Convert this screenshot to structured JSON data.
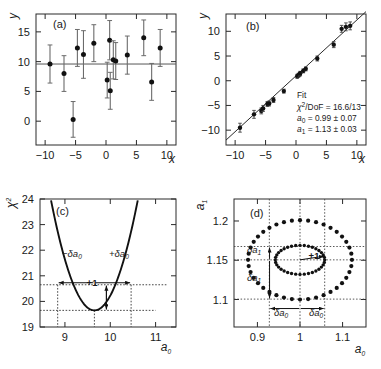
{
  "figure": {
    "panels": [
      "(a)",
      "(b)",
      "(c)",
      "(d)"
    ]
  },
  "panel_a": {
    "label": "(a)",
    "xlabel": "x",
    "ylabel": "y"
  },
  "panel_b": {
    "label": "(b)",
    "xlabel": "x",
    "ylabel": "y",
    "fit_title": "Fit",
    "fit_chi2": "/DoF = 16.6/13",
    "fit_chi2_sym": "χ",
    "fit_chi2_sup": "2",
    "fit_a0": " = 0.99 ± 0.07",
    "fit_a1": " = 1.13 ± 0.03",
    "fit_a_sym": "a",
    "fit_a0_sub": "0",
    "fit_a1_sub": "1"
  },
  "panel_c": {
    "label": "(c)",
    "xlabel_sym": "a",
    "xlabel_sub": "0",
    "ylabel_sym": "χ",
    "ylabel_sup": "2",
    "annot_minus": "−δa",
    "annot_plus": "+δa",
    "annot_sub": "0",
    "annot_plus_one": "+1"
  },
  "panel_d": {
    "label": "(d)",
    "xlabel_sym": "a",
    "xlabel_sub": "0",
    "ylabel_sym": "a",
    "ylabel_sub": "1",
    "annot_da1": "δa",
    "annot_da1_sub": "1",
    "annot_da0": "δa",
    "annot_da0_sub": "0",
    "annot_plus_one": "+1"
  },
  "chart_data": [
    {
      "type": "scatter",
      "panel": "(a)",
      "title": "(a)",
      "xlabel": "x",
      "ylabel": "y",
      "xlim": [
        -11.5,
        11.5
      ],
      "ylim": [
        -4.0,
        18.0
      ],
      "xticks": [
        -10,
        -5,
        0,
        5,
        10
      ],
      "yticks": [
        0,
        5,
        10,
        15
      ],
      "grid": false,
      "hline": 9.6,
      "x": [
        -9.2,
        -6.9,
        -5.4,
        -4.7,
        -3.7,
        -2.0,
        0.2,
        0.6,
        0.7,
        1.2,
        1.6,
        3.5,
        6.2,
        7.5,
        8.9
      ],
      "y": [
        9.6,
        8.0,
        0.3,
        12.3,
        11.2,
        13.1,
        6.9,
        13.6,
        5.1,
        10.3,
        10.1,
        11.1,
        14.0,
        6.6,
        12.3
      ],
      "yerr": [
        3.2,
        3.0,
        3.0,
        3.1,
        4.0,
        3.1,
        3.0,
        3.3,
        3.1,
        3.2,
        3.1,
        3.2,
        3.0,
        3.1,
        3.1
      ]
    },
    {
      "type": "scatter",
      "panel": "(b)",
      "title": "(b)",
      "xlabel": "x",
      "ylabel": "y",
      "xlim": [
        -11.5,
        11.5
      ],
      "ylim": [
        -13.0,
        13.5
      ],
      "xticks": [
        -10,
        -5,
        0,
        5,
        10
      ],
      "yticks": [
        -10,
        -5,
        0,
        5,
        10
      ],
      "grid": false,
      "fit_line": {
        "intercept": 0.99,
        "slope": 1.13
      },
      "x": [
        -9.2,
        -6.9,
        -5.7,
        -5.4,
        -4.7,
        -4.4,
        -3.7,
        -2.0,
        0.2,
        0.4,
        0.6,
        0.7,
        1.2,
        1.6,
        3.5,
        6.2,
        7.5,
        8.2,
        8.9
      ],
      "y": [
        -9.5,
        -6.8,
        -6.1,
        -5.6,
        -4.7,
        -4.6,
        -3.9,
        -2.1,
        0.9,
        1.1,
        1.3,
        1.5,
        2.0,
        2.4,
        4.5,
        7.3,
        10.5,
        10.9,
        11.1
      ],
      "yerr": [
        0.9,
        0.8,
        0.6,
        0.6,
        0.5,
        0.5,
        0.5,
        0.4,
        0.4,
        0.4,
        0.4,
        0.4,
        0.4,
        0.4,
        0.5,
        0.6,
        0.7,
        0.8,
        0.8
      ],
      "annotations": [
        "Fit",
        "χ²/DoF = 16.6/13",
        "a₀ = 0.99 ± 0.07",
        "a₁ = 1.13 ± 0.03"
      ]
    },
    {
      "type": "line",
      "panel": "(c)",
      "title": "(c)",
      "xlabel": "a₀",
      "ylabel": "χ²",
      "xlim": [
        8.45,
        11.45
      ],
      "ylim": [
        19.0,
        24.0
      ],
      "xticks": [
        9,
        10,
        11
      ],
      "yticks": [
        19,
        20,
        21,
        22,
        23,
        24
      ],
      "grid": false,
      "parabola": {
        "vertex_x": 9.65,
        "vertex_y": 19.65,
        "curvature": 4.7
      },
      "chi2_min": 19.65,
      "a0_best": 9.65,
      "a0_minus": 8.84,
      "a0_plus": 10.46,
      "chi2_plus_one": 20.65,
      "annotations": [
        "−δa₀",
        "+δa₀",
        "+1"
      ]
    },
    {
      "type": "scatter",
      "panel": "(d)",
      "title": "(d)",
      "xlabel": "a₀",
      "ylabel": "a₁",
      "xlim": [
        0.845,
        1.155
      ],
      "ylim": [
        1.065,
        1.228
      ],
      "xticks": [
        0.9,
        1,
        1.1
      ],
      "yticks": [
        1.1,
        1.15,
        1.2
      ],
      "grid": true,
      "center": [
        1.0,
        1.1505
      ],
      "ellipse_outer": {
        "rx": 0.122,
        "ry": 0.0505,
        "n_points": 40
      },
      "ellipse_inner": {
        "rx": 0.058,
        "ry": 0.0185,
        "n_points": 36
      },
      "a0_minus": 0.928,
      "a0_plus": 1.058,
      "a1_minus": 1.1005,
      "a1_plus": 1.1675,
      "annotations": [
        "δa₁",
        "δa₁",
        "δa₀",
        "δa₀",
        "+1"
      ]
    }
  ]
}
